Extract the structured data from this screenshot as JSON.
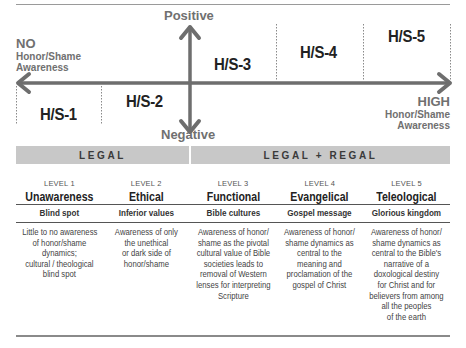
{
  "diagram": {
    "vertical_axis": {
      "top_label": "Positive",
      "bottom_label": "Negative"
    },
    "horizontal_axis": {
      "left_label": "NO",
      "left_sublabel_lines": [
        "Honor/Shame",
        "Awareness"
      ],
      "right_label": "HIGH",
      "right_sublabel_lines": [
        "Honor/Shame",
        "Awareness"
      ]
    },
    "stages": [
      "H/S-1",
      "H/S-2",
      "H/S-3",
      "H/S-4",
      "H/S-5"
    ],
    "colors": {
      "arrow": "#6e6e6e",
      "band": "#c8c8c8",
      "divider": "#8a8a8a"
    }
  },
  "bands": [
    {
      "label": "LEGAL"
    },
    {
      "label": "LEGAL + REGAL"
    }
  ],
  "levels": [
    {
      "level": "LEVEL 1",
      "title": "Unawareness",
      "subtitle": "Blind spot",
      "description_lines": [
        "Little to no awareness",
        "of honor/shame",
        "dynamics;",
        "cultural / theological",
        "blind spot"
      ]
    },
    {
      "level": "LEVEL 2",
      "title": "Ethical",
      "subtitle": "Inferior values",
      "description_lines": [
        "Awareness of only",
        "the unethical",
        "or dark side of",
        "honor/shame"
      ]
    },
    {
      "level": "LEVEL 3",
      "title": "Functional",
      "subtitle": "Bible cultures",
      "description_lines": [
        "Awareness of honor/",
        "shame as the pivotal",
        "cultural value of Bible",
        "societies leads to",
        "removal of Western",
        "lenses for interpreting",
        "Scripture"
      ]
    },
    {
      "level": "LEVEL 4",
      "title": "Evangelical",
      "subtitle": "Gospel message",
      "description_lines": [
        "Awareness of honor/",
        "shame dynamics as",
        "central to the",
        "meaning and",
        "proclamation of the",
        "gospel of Christ"
      ]
    },
    {
      "level": "LEVEL 5",
      "title": "Teleological",
      "subtitle": "Glorious kingdom",
      "description_lines": [
        "Awareness of honor/",
        "shame dynamics as",
        "central to the Bible's",
        "narrative of a",
        "doxological destiny",
        "for Christ and for",
        "believers from among",
        "all the peoples",
        "of the earth"
      ]
    }
  ]
}
